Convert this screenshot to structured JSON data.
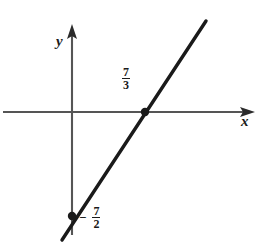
{
  "figure": {
    "background_color": "#ffffff",
    "width": 262,
    "height": 245
  },
  "axes": {
    "x_label": "x",
    "y_label": "y",
    "color": "#555555",
    "origin": {
      "x": 72,
      "y": 112
    },
    "x_axis": {
      "start_x": 3,
      "end_x": 255,
      "y": 112,
      "arrow": "right"
    },
    "y_axis": {
      "x": 72,
      "start_y": 235,
      "end_y": 25,
      "arrow": "up"
    }
  },
  "line": {
    "color": "#1a1a1a",
    "stroke_width": 3.4,
    "start": {
      "x": 62,
      "y": 240
    },
    "end": {
      "x": 206,
      "y": 21
    }
  },
  "points": [
    {
      "name": "x-intercept",
      "x": 145,
      "y": 112,
      "radius": 4.2,
      "color": "#1a1a1a"
    },
    {
      "name": "y-intercept",
      "x": 72,
      "y": 216,
      "radius": 4.2,
      "color": "#1a1a1a"
    }
  ],
  "labels": {
    "x_intercept": {
      "sign": "",
      "numerator": "7",
      "denominator": "3"
    },
    "y_intercept": {
      "sign": "−",
      "numerator": "7",
      "denominator": "2"
    }
  },
  "chart_data": {
    "type": "line",
    "title": "",
    "xlabel": "x",
    "ylabel": "y",
    "grid": false,
    "legend": null,
    "series": [
      {
        "name": "line",
        "x_intercept": 2.3333,
        "y_intercept": -3.5,
        "slope": 1.5,
        "equation": "y = (3/2)x - 7/2",
        "points": [
          {
            "x": 2.3333,
            "y": 0,
            "label": "7/3",
            "marker": true
          },
          {
            "x": 0,
            "y": -3.5,
            "label": "-7/2",
            "marker": true
          }
        ]
      }
    ],
    "annotations": [
      {
        "text": "7/3",
        "display": "7 over 3",
        "near": "x-intercept"
      },
      {
        "text": "-7/2",
        "display": "minus 7 over 2",
        "near": "y-intercept"
      }
    ]
  }
}
